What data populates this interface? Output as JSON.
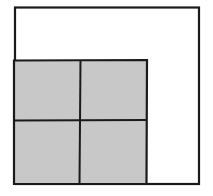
{
  "diagram": {
    "outer_square": {
      "x": 15,
      "y": 7,
      "width": 184,
      "height": 177,
      "fill": "#ffffff",
      "stroke": "#1a1a1a"
    },
    "shaded_region": {
      "x": 14,
      "y": 60,
      "width": 133,
      "height": 124,
      "fill": "#c8c8c8",
      "stroke": "#1a1a1a"
    },
    "grid": {
      "rows": 2,
      "cols": 2,
      "divider_x": 80,
      "divider_y": 120
    },
    "colors": {
      "line": "#1a1a1a",
      "shade": "#c8c8c8",
      "background": "#ffffff"
    }
  }
}
